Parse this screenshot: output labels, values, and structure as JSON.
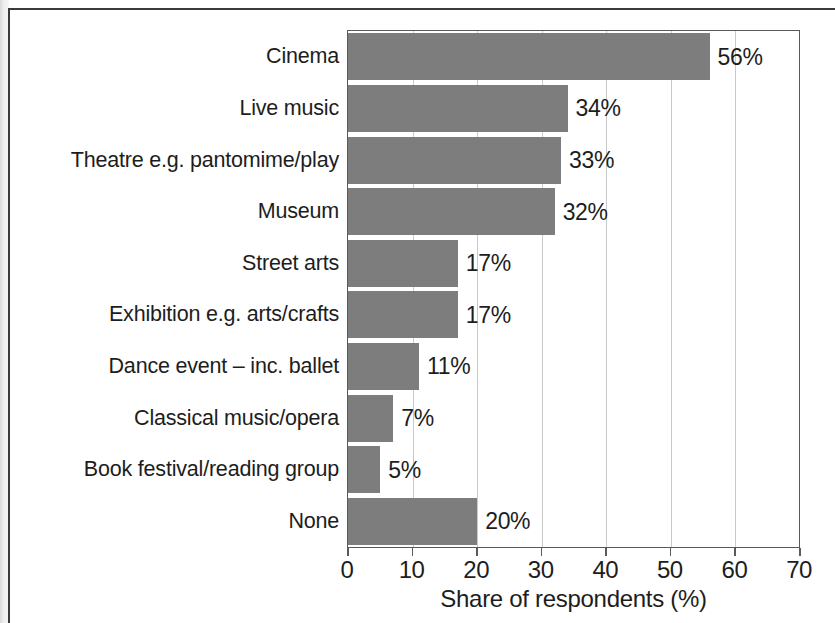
{
  "chart_data": {
    "type": "bar",
    "orientation": "horizontal",
    "title": "",
    "xlabel": "Share of respondents (%)",
    "ylabel": "",
    "xlim": [
      0,
      70
    ],
    "xticks": [
      "0",
      "10",
      "20",
      "30",
      "40",
      "50",
      "60",
      "70"
    ],
    "grid": "vertical",
    "legend": "none",
    "bar_color": "#7d7d7d",
    "categories": [
      "Cinema",
      "Live music",
      "Theatre e.g. pantomime/play",
      "Museum",
      "Street arts",
      "Exhibition e.g. arts/crafts",
      "Dance event – inc. ballet",
      "Classical music/opera",
      "Book festival/reading group",
      "None"
    ],
    "values": [
      56,
      34,
      33,
      32,
      17,
      17,
      11,
      7,
      5,
      20
    ],
    "value_labels": [
      "56%",
      "34%",
      "33%",
      "32%",
      "17%",
      "17%",
      "11%",
      "7%",
      "5%",
      "20%"
    ]
  }
}
